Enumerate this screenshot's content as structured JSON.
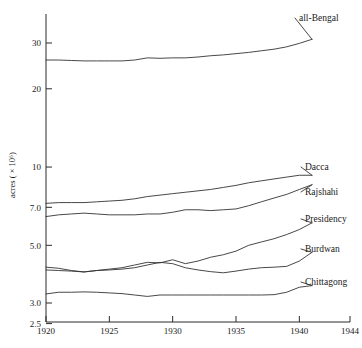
{
  "chart_data": {
    "type": "line",
    "title": "",
    "xlabel": "",
    "ylabel": "acres ( × 10⁶)",
    "yscale": "log",
    "xlim": [
      1920,
      1944
    ],
    "ylim": [
      2.5,
      35
    ],
    "grid": false,
    "legend_position": "right-inline-labels",
    "ytick_labels": [
      "30",
      "20",
      "10",
      "7.0",
      "5.0",
      "3.0",
      "2.5"
    ],
    "ytick_values": [
      30,
      20,
      10,
      7.0,
      5.0,
      3.0,
      2.5
    ],
    "xtick_labels": [
      "1920",
      "1925",
      "1930",
      "1935",
      "1940",
      "1944"
    ],
    "xtick_values": [
      1920,
      1925,
      1930,
      1935,
      1940,
      1944
    ],
    "x": [
      1920,
      1921,
      1922,
      1923,
      1924,
      1925,
      1926,
      1927,
      1928,
      1929,
      1930,
      1931,
      1932,
      1933,
      1934,
      1935,
      1936,
      1937,
      1938,
      1939,
      1940,
      1941
    ],
    "series": [
      {
        "name": "all-Bengal",
        "label": "all-Bengal",
        "values": [
          25.8,
          25.8,
          25.7,
          25.6,
          25.6,
          25.6,
          25.6,
          25.8,
          26.3,
          26.2,
          26.3,
          26.3,
          26.5,
          26.8,
          27.0,
          27.3,
          27.6,
          28.0,
          28.4,
          29.0,
          29.9,
          31.0
        ]
      },
      {
        "name": "Dacca",
        "label": "Dacca",
        "values": [
          7.25,
          7.3,
          7.3,
          7.3,
          7.35,
          7.4,
          7.45,
          7.55,
          7.7,
          7.8,
          7.9,
          8.0,
          8.1,
          8.2,
          8.35,
          8.5,
          8.7,
          8.85,
          9.0,
          9.15,
          9.3,
          9.3
        ]
      },
      {
        "name": "Rajshahi",
        "label": "Rajshahi",
        "values": [
          6.45,
          6.55,
          6.6,
          6.65,
          6.6,
          6.55,
          6.55,
          6.55,
          6.6,
          6.6,
          6.7,
          6.85,
          6.85,
          6.8,
          6.85,
          6.9,
          7.1,
          7.35,
          7.6,
          7.85,
          8.2,
          8.55
        ]
      },
      {
        "name": "Presidency",
        "label": "Presidency",
        "values": [
          4.12,
          4.08,
          4.0,
          3.95,
          4.0,
          4.05,
          4.1,
          4.2,
          4.3,
          4.28,
          4.4,
          4.25,
          4.35,
          4.5,
          4.6,
          4.75,
          5.0,
          5.15,
          5.3,
          5.5,
          5.75,
          6.1
        ]
      },
      {
        "name": "Burdwan",
        "label": "Burdwan",
        "values": [
          4.02,
          4.0,
          3.98,
          3.95,
          4.0,
          4.02,
          4.05,
          4.1,
          4.2,
          4.3,
          4.25,
          4.1,
          4.02,
          3.96,
          3.92,
          3.98,
          4.05,
          4.1,
          4.12,
          4.15,
          4.35,
          4.7
        ]
      },
      {
        "name": "Chittagong",
        "label": "Chittagong",
        "values": [
          3.25,
          3.3,
          3.3,
          3.31,
          3.3,
          3.28,
          3.26,
          3.22,
          3.18,
          3.22,
          3.22,
          3.22,
          3.22,
          3.22,
          3.22,
          3.22,
          3.22,
          3.22,
          3.23,
          3.3,
          3.45,
          3.5
        ]
      }
    ],
    "series_label_positions": [
      {
        "name": "all-Bengal",
        "x": 299,
        "y": 21
      },
      {
        "name": "Dacca",
        "x": 305,
        "y": 170
      },
      {
        "name": "Rajshahi",
        "x": 305,
        "y": 195
      },
      {
        "name": "Presidency",
        "x": 305,
        "y": 222
      },
      {
        "name": "Burdwan",
        "x": 305,
        "y": 252
      },
      {
        "name": "Chittagong",
        "x": 305,
        "y": 285
      }
    ],
    "colors": {
      "line": "#333333",
      "axis": "#2b2b2b",
      "text": "#1a1a1a",
      "background": "#ffffff"
    }
  }
}
